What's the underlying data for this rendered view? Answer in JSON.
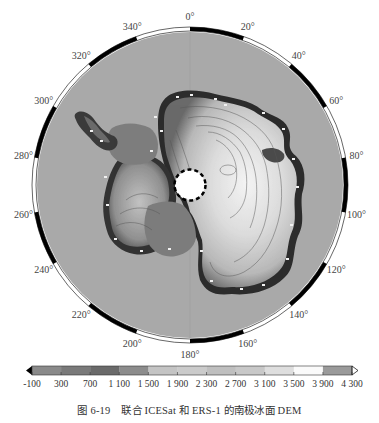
{
  "figure": {
    "caption_number": "图 6-19",
    "caption_text": "联合 ICESat 和 ERS-1 的南极冰面 DEM"
  },
  "map": {
    "projection": "south-polar-stereographic",
    "center": [
      190,
      185
    ],
    "radius": 155,
    "ocean_color": "#a9a9a9",
    "pole_hole_color": "#ffffff",
    "longitude_labels": [
      "0°",
      "20°",
      "40°",
      "60°",
      "80°",
      "100°",
      "120°",
      "140°",
      "160°",
      "180°",
      "200°",
      "220°",
      "240°",
      "260°",
      "280°",
      "300°",
      "320°",
      "340°"
    ]
  },
  "colorbar": {
    "min": -100,
    "max": 4300,
    "tick_labels": [
      "-100",
      "300",
      "700",
      "1 100",
      "1 500",
      "1 900",
      "2 300",
      "2 700",
      "3 100",
      "3 500",
      "3 900",
      "4 300"
    ],
    "colors": [
      "#8a8a8a",
      "#7a7a7a",
      "#6a6a6a",
      "#8c8c8c",
      "#c4c4c4",
      "#cbcbcb",
      "#bfbfbf",
      "#c8c8c8",
      "#dedede",
      "#fafafa",
      "#9a9a9a"
    ],
    "extend": "both"
  },
  "chart_data": {
    "type": "heatmap",
    "title": "联合 ICESat 和 ERS-1 的南极冰面 DEM",
    "xlabel": "Longitude",
    "ylabel": "",
    "colorbar_range": [
      -100,
      4300
    ],
    "colorbar_ticks": [
      -100,
      300,
      700,
      1100,
      1500,
      1900,
      2300,
      2700,
      3100,
      3500,
      3900,
      4300
    ],
    "longitude_ticks_deg": [
      0,
      20,
      40,
      60,
      80,
      100,
      120,
      140,
      160,
      180,
      200,
      220,
      240,
      260,
      280,
      300,
      320,
      340
    ],
    "units": "m"
  }
}
